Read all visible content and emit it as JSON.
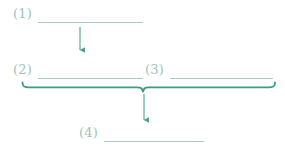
{
  "diagram": {
    "type": "flow-steps",
    "background_color": "#ffffff",
    "canvas": {
      "width": 285,
      "height": 151
    },
    "palette": {
      "label_color": "#9cc3ba",
      "underline_color": "#a9cdc5",
      "brace_color": "#3d9b83",
      "arrow_color": "#4f9e8b"
    },
    "nodes": [
      {
        "id": "step-1",
        "label": "(1)",
        "label_x": 13,
        "label_y": 7,
        "underline": {
          "x1": 38,
          "x2": 143,
          "y": 22
        }
      },
      {
        "id": "step-2",
        "label": "(2)",
        "label_x": 13,
        "label_y": 63,
        "underline": {
          "x1": 38,
          "x2": 143,
          "y": 78
        }
      },
      {
        "id": "step-3",
        "label": "(3)",
        "label_x": 145,
        "label_y": 63,
        "underline": {
          "x1": 170,
          "x2": 273,
          "y": 78
        }
      },
      {
        "id": "step-4",
        "label": "(4)",
        "label_x": 79,
        "label_y": 126,
        "underline": {
          "x1": 104,
          "x2": 204,
          "y": 141
        }
      }
    ],
    "arrows": [
      {
        "id": "arrow-1-to-2",
        "x": 80,
        "y1": 27,
        "y2": 55,
        "direction": "down"
      },
      {
        "id": "arrow-brace-to-4",
        "x": 144,
        "y1": 93,
        "y2": 125,
        "direction": "down"
      }
    ],
    "brace": {
      "id": "grouping-brace",
      "x1": 22,
      "x2": 275,
      "y": 87,
      "center_x": 143,
      "orientation": "horizontal-down"
    }
  }
}
